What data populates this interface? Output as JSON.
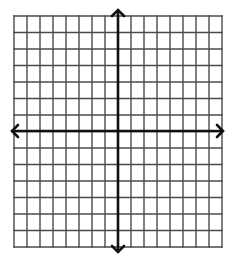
{
  "diagram": {
    "type": "coordinate-grid",
    "grid": {
      "columns": 16,
      "rows": 14,
      "left": 14,
      "right": 222,
      "top": 16,
      "bottom": 247,
      "line_color": "#4a4a4a",
      "line_width": 1.4
    },
    "axes": {
      "x_axis": {
        "y": 131,
        "from_x": 12,
        "to_x": 223,
        "arrows": "both"
      },
      "y_axis": {
        "x": 118,
        "from_y": 10,
        "to_y": 252,
        "arrows": "both"
      },
      "color": "#111111",
      "width": 2.6
    },
    "background": "#ffffff"
  }
}
